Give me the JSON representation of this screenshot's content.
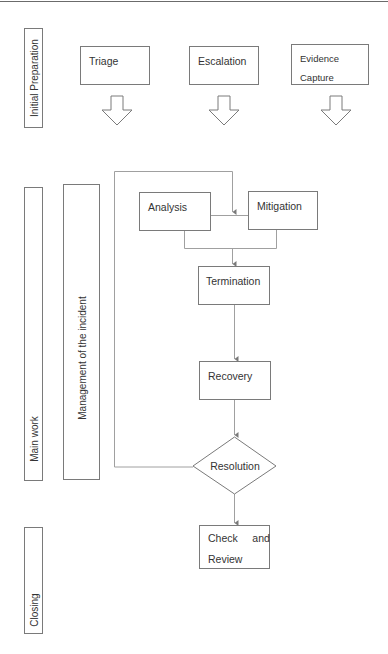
{
  "lanes": {
    "initial_preparation": "Initial Preparation",
    "main_work": "Main work",
    "management": "Management of the incident",
    "closing": "Closing"
  },
  "preparation_steps": [
    {
      "label": "Triage"
    },
    {
      "label": "Escalation"
    },
    {
      "label": "Evidence Capture",
      "line1": "Evidence",
      "line2": "Capture"
    }
  ],
  "process": {
    "analysis": "Analysis",
    "mitigation": "Mitigation",
    "termination": "Termination",
    "recovery": "Recovery",
    "resolution": "Resolution",
    "check_review": {
      "line1": "Check     and",
      "line2": "Review"
    }
  },
  "colors": {
    "stroke": "#7a7a7a",
    "connector": "#a0a0a0",
    "text": "#333333"
  }
}
